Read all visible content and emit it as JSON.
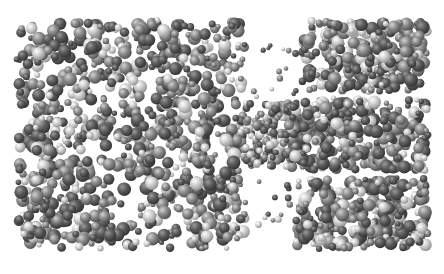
{
  "image": {
    "description": "Molecular dynamics snapshot of two liquid slabs connected by a thin bridge of molecules (capillary neck), rendered as shaded gray spheres",
    "width": 444,
    "height": 274,
    "background": "#ffffff",
    "frame": {
      "x": 13,
      "y": 17,
      "width": 419,
      "height": 235
    }
  },
  "palette": {
    "dark": {
      "hi": "#9a9a9a",
      "mid": "#5c5c5c",
      "lo": "#2e2e2e"
    },
    "mid": {
      "hi": "#d2d2d2",
      "mid": "#8c8c8c",
      "lo": "#4a4a4a"
    },
    "light": {
      "hi": "#ffffff",
      "mid": "#cfcfcf",
      "lo": "#8a8a8a"
    }
  },
  "regions": [
    {
      "name": "left-slab",
      "x0": 13,
      "x1": 250,
      "y0": 17,
      "y1": 252,
      "count": 900,
      "rmin": 2.5,
      "rmax": 7
    },
    {
      "name": "right-slab-top",
      "x0": 298,
      "x1": 432,
      "y0": 17,
      "y1": 95,
      "count": 260,
      "rmin": 2.5,
      "rmax": 7
    },
    {
      "name": "right-slab-mid",
      "x0": 282,
      "x1": 432,
      "y0": 95,
      "y1": 175,
      "count": 300,
      "rmin": 2.5,
      "rmax": 7
    },
    {
      "name": "right-slab-bottom",
      "x0": 292,
      "x1": 432,
      "y0": 175,
      "y1": 252,
      "count": 270,
      "rmin": 2.5,
      "rmax": 7
    },
    {
      "name": "neck-bridge",
      "x0": 236,
      "x1": 300,
      "y0": 100,
      "y1": 170,
      "count": 150,
      "rmin": 2.5,
      "rmax": 4.5
    },
    {
      "name": "stray-top",
      "x0": 250,
      "x1": 300,
      "y0": 40,
      "y1": 100,
      "count": 14,
      "rmin": 2,
      "rmax": 3.5
    },
    {
      "name": "stray-bottom",
      "x0": 255,
      "x1": 295,
      "y0": 170,
      "y1": 230,
      "count": 12,
      "rmin": 2,
      "rmax": 3.5
    }
  ],
  "caption": ""
}
